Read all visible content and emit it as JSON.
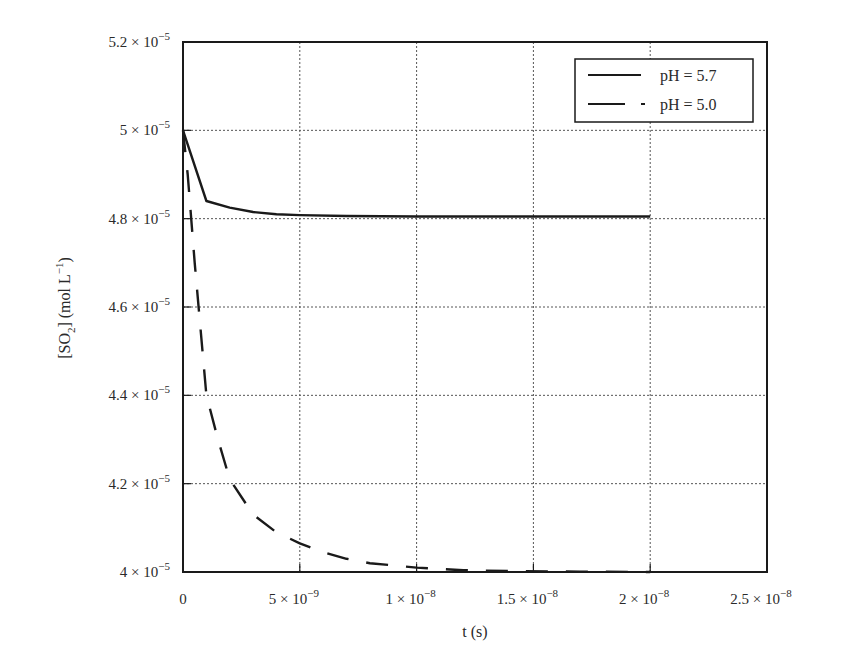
{
  "chart_data": {
    "type": "line",
    "title": "",
    "xlabel": "t (s)",
    "ylabel": "[SO2] (mol L-1)",
    "ylabel_parts": {
      "open": "[SO",
      "sub": "2",
      "close": "] (mol L",
      "sup": "−1",
      "end": ")"
    },
    "xlim": [
      0,
      2.5e-08
    ],
    "ylim": [
      4e-05,
      5.2e-05
    ],
    "grid": true,
    "legend_position": "upper right",
    "x_ticks": [
      {
        "value": 0,
        "mant": "0",
        "exp": ""
      },
      {
        "value": 5e-09,
        "mant": "5 × 10",
        "exp": "−9"
      },
      {
        "value": 1e-08,
        "mant": "1 × 10",
        "exp": "−8"
      },
      {
        "value": 1.5e-08,
        "mant": "1.5 × 10",
        "exp": "−8"
      },
      {
        "value": 2e-08,
        "mant": "2 × 10",
        "exp": "−8"
      },
      {
        "value": 2.5e-08,
        "mant": "2.5 × 10",
        "exp": "−8"
      }
    ],
    "y_ticks": [
      {
        "value": 4e-05,
        "mant": "4 × 10",
        "exp": "−5"
      },
      {
        "value": 4.2e-05,
        "mant": "4.2 × 10",
        "exp": "−5"
      },
      {
        "value": 4.4e-05,
        "mant": "4.4 × 10",
        "exp": "−5"
      },
      {
        "value": 4.6e-05,
        "mant": "4.6 × 10",
        "exp": "−5"
      },
      {
        "value": 4.8e-05,
        "mant": "4.8 × 10",
        "exp": "−5"
      },
      {
        "value": 5e-05,
        "mant": "5 × 10",
        "exp": "−5"
      },
      {
        "value": 5.2e-05,
        "mant": "5.2 × 10",
        "exp": "−5"
      }
    ],
    "series": [
      {
        "name": "pH = 5.7",
        "style": "solid",
        "x": [
          0,
          1e-09,
          2e-09,
          3e-09,
          4e-09,
          5e-09,
          7e-09,
          1e-08,
          1.5e-08,
          2e-08
        ],
        "values": [
          5e-05,
          4.84e-05,
          4.825e-05,
          4.815e-05,
          4.81e-05,
          4.808e-05,
          4.806e-05,
          4.805e-05,
          4.805e-05,
          4.805e-05
        ]
      },
      {
        "name": "pH = 5.0",
        "style": "dashed",
        "x": [
          0,
          2e-10,
          5e-10,
          1e-09,
          1.5e-09,
          2e-09,
          3e-09,
          4e-09,
          5e-09,
          6e-09,
          7e-09,
          8e-09,
          1e-08,
          1.2e-08,
          1.4e-08,
          1.7e-08,
          2e-08
        ],
        "values": [
          5e-05,
          4.9e-05,
          4.7e-05,
          4.4e-05,
          4.3e-05,
          4.21e-05,
          4.13e-05,
          4.09e-05,
          4.065e-05,
          4.045e-05,
          4.03e-05,
          4.02e-05,
          4.01e-05,
          4.004e-05,
          4.002e-05,
          4.001e-05,
          4e-05
        ]
      }
    ]
  },
  "legend": {
    "items": [
      {
        "label": "pH = 5.7",
        "style": "solid"
      },
      {
        "label": "pH = 5.0",
        "style": "dashed"
      }
    ]
  },
  "colors": {
    "line": "#1a1a1a",
    "grid": "#555555",
    "frame": "#1a1a1a",
    "background": "#ffffff"
  }
}
